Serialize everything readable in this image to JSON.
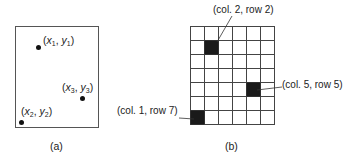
{
  "panel_a": {
    "caption": "(a)",
    "points": [
      {
        "var": "x",
        "sub": "1",
        "var2": "y",
        "sub2": "1"
      },
      {
        "var": "x",
        "sub": "3",
        "var2": "y",
        "sub2": "3"
      },
      {
        "var": "x",
        "sub": "2",
        "var2": "y",
        "sub2": "2"
      }
    ]
  },
  "panel_b": {
    "caption": "(b)",
    "grid": {
      "cols": 6,
      "rows": 7
    },
    "filled_cells": [
      {
        "col": 2,
        "row": 2,
        "label": "(col. 2, row 2)"
      },
      {
        "col": 5,
        "row": 5,
        "label": "(col. 5, row 5)"
      },
      {
        "col": 1,
        "row": 7,
        "label": "(col. 1, row 7)"
      }
    ]
  },
  "colors": {
    "ink": "#222222",
    "fill": "#1a1a1a"
  }
}
